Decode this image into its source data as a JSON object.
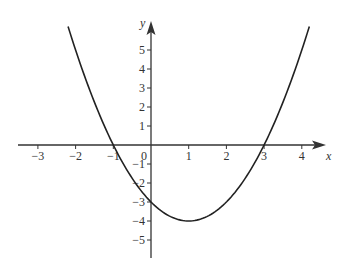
{
  "chart_data": {
    "type": "line",
    "title": "",
    "function": "y = x^2 - 2x - 3",
    "xlabel": "x",
    "ylabel": "y",
    "xlim": [
      -3.5,
      4.6
    ],
    "ylim": [
      -5.9,
      6.4
    ],
    "grid": false,
    "legend": null,
    "x_ticks": [
      -3,
      -2,
      -1,
      0,
      1,
      2,
      3,
      4
    ],
    "x_tick_labels": [
      "−3",
      "−2",
      "−1",
      "0",
      "1",
      "2",
      "3",
      "4"
    ],
    "y_ticks": [
      -5,
      -4,
      -3,
      -2,
      -1,
      1,
      2,
      3,
      4,
      5
    ],
    "y_tick_labels": [
      "−5",
      "−4",
      "−3",
      "−2",
      "−1",
      "1",
      "2",
      "3",
      "4",
      "5"
    ],
    "series": [
      {
        "name": "parabola",
        "x_range": [
          -2.2,
          4.2
        ],
        "x": [
          -2.2,
          -2,
          -1.5,
          -1,
          -0.5,
          0,
          0.5,
          1,
          1.5,
          2,
          2.5,
          3,
          3.5,
          4,
          4.2
        ],
        "values": [
          6.24,
          5,
          2.25,
          0,
          -1.75,
          -3,
          -3.75,
          -4,
          -3.75,
          -3,
          -1.75,
          0,
          2.25,
          5,
          6.24
        ]
      }
    ],
    "key_points": {
      "x_intercepts": [
        -1,
        3
      ],
      "y_intercept": -3,
      "vertex": [
        1,
        -4
      ]
    },
    "colors": {
      "curve": "#222222",
      "axes": "#333333"
    }
  }
}
